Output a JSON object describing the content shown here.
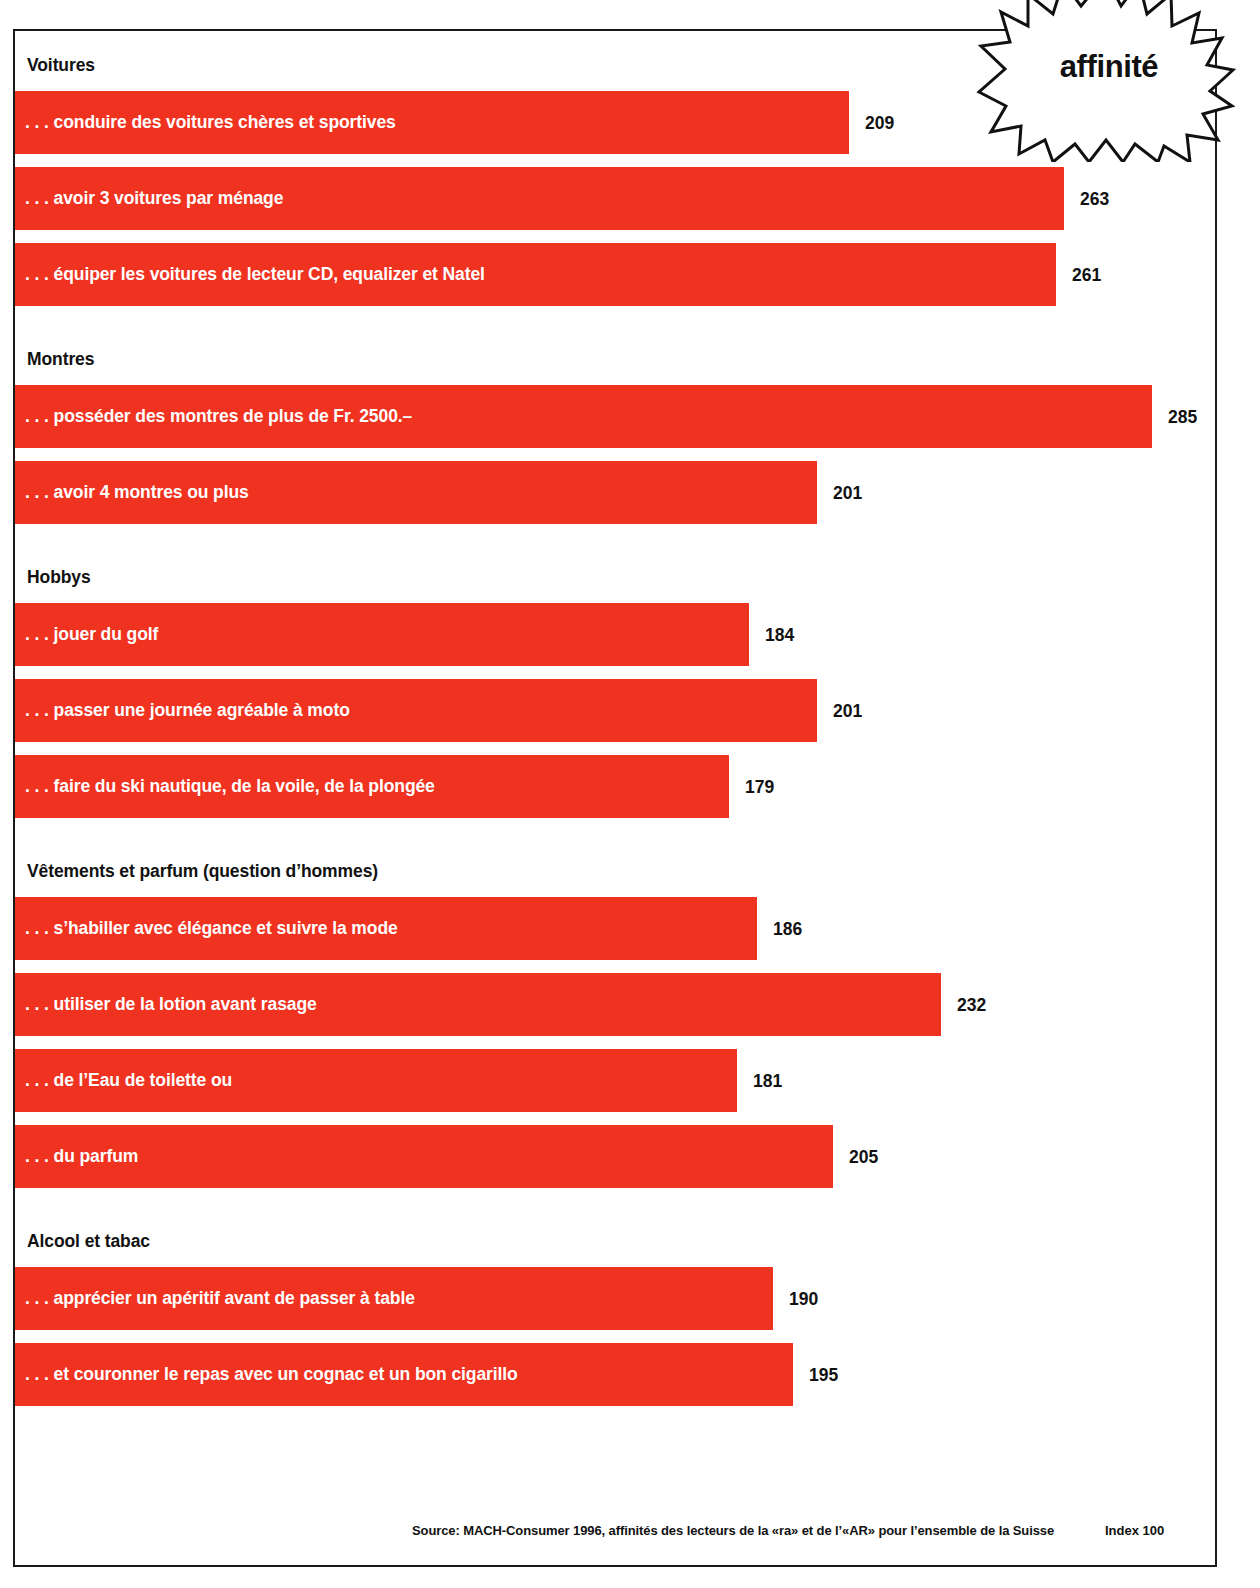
{
  "badge": {
    "label": "affinité",
    "icon": "starburst-icon"
  },
  "footer": {
    "source": "Source: MACH-Consumer 1996, affinités des lecteurs de la «ra» et de l’«AR» pour l’ensemble de la Suisse",
    "index": "Index 100"
  },
  "colors": {
    "bar": "#f03221",
    "text_dark": "#111111",
    "text_on_bar": "#ffffff",
    "frame": "#1a1a1a"
  },
  "chart_data": {
    "type": "bar",
    "orientation": "horizontal",
    "title": "affinité",
    "xlabel": "",
    "ylabel": "",
    "baseline_index": 100,
    "index_note": "Index 100",
    "source": "Source: MACH-Consumer 1996, affinités des lecteurs de la «ra» et de l’«AR» pour l’ensemble de la Suisse",
    "grid": false,
    "legend": "none",
    "xlim": [
      0,
      300
    ],
    "groups": [
      {
        "name": "Voitures",
        "items": [
          {
            "label": ". . . conduire des voitures chères et sportives",
            "value": 209
          },
          {
            "label": ". . . avoir 3 voitures par ménage",
            "value": 263
          },
          {
            "label": ". . . équiper les voitures de lecteur CD, equalizer et Natel",
            "value": 261
          }
        ]
      },
      {
        "name": "Montres",
        "items": [
          {
            "label": ". . . posséder des montres de plus de Fr. 2500.–",
            "value": 285
          },
          {
            "label": ". . . avoir 4 montres ou plus",
            "value": 201
          }
        ]
      },
      {
        "name": "Hobbys",
        "items": [
          {
            "label": ". . . jouer du golf",
            "value": 184
          },
          {
            "label": ". . . passer une journée agréable à moto",
            "value": 201
          },
          {
            "label": ". . . faire du ski nautique, de la voile, de la plongée",
            "value": 179
          }
        ]
      },
      {
        "name": "Vêtements et parfum (question d’hommes)",
        "items": [
          {
            "label": ". . . s’habiller avec élégance et suivre la mode",
            "value": 186
          },
          {
            "label": ". . . utiliser de la lotion avant rasage",
            "value": 232
          },
          {
            "label": ". . . de l’Eau de toilette ou",
            "value": 181
          },
          {
            "label": ". . . du parfum",
            "value": 205
          }
        ]
      },
      {
        "name": "Alcool et tabac",
        "items": [
          {
            "label": ". . . apprécier un apéritif avant de passer à table",
            "value": 190
          },
          {
            "label": ". . . et couronner le repas avec un cognac et un bon cigarillo",
            "value": 195
          }
        ]
      }
    ],
    "categories": [
      ". . . conduire des voitures chères et sportives",
      ". . . avoir 3 voitures par ménage",
      ". . . équiper les voitures de lecteur CD, equalizer et Natel",
      ". . . posséder des montres de plus de Fr. 2500.–",
      ". . . avoir 4 montres ou plus",
      ". . . jouer du golf",
      ". . . passer une journée agréable à moto",
      ". . . faire du ski nautique, de la voile, de la plongée",
      ". . . s’habiller avec élégance et suivre la mode",
      ". . . utiliser de la lotion avant rasage",
      ". . . de l’Eau de toilette ou",
      ". . . du parfum",
      ". . . apprécier un apéritif avant de passer à table",
      ". . . et couronner le repas avec un cognac et un bon cigarillo"
    ],
    "values": [
      209,
      263,
      261,
      285,
      201,
      184,
      201,
      179,
      186,
      232,
      181,
      205,
      190,
      195
    ]
  }
}
